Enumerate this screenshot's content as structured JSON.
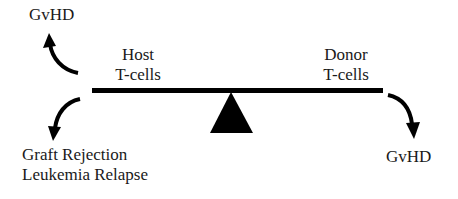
{
  "diagram": {
    "type": "balance-seesaw",
    "left_side": {
      "label_line1": "Host",
      "label_line2": "T-cells",
      "up_outcome": "GvHD",
      "down_outcome_line1": "Graft Rejection",
      "down_outcome_line2": "Leukemia Relapse"
    },
    "right_side": {
      "label_line1": "Donor",
      "label_line2": "T-cells",
      "down_outcome": "GvHD"
    },
    "colors": {
      "ink": "#000000",
      "text": "#1a1a1a",
      "background": "#ffffff"
    }
  }
}
